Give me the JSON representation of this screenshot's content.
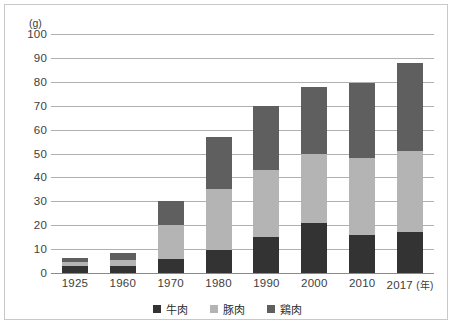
{
  "chart_data": {
    "type": "bar",
    "subtype": "stacked",
    "title": "",
    "xlabel": "",
    "ylabel": "",
    "unit_label": "(g)",
    "x_axis_unit": "(年)",
    "categories": [
      "1925",
      "1960",
      "1970",
      "1980",
      "1990",
      "2000",
      "2010",
      "2017"
    ],
    "ylim": [
      0,
      100
    ],
    "ytick_labels": [
      "0",
      "10",
      "20",
      "30",
      "40",
      "50",
      "60",
      "70",
      "80",
      "90",
      "100"
    ],
    "ytick_values": [
      0,
      10,
      20,
      30,
      40,
      50,
      60,
      70,
      80,
      90,
      100
    ],
    "grid": true,
    "legend_position": "bottom",
    "series": [
      {
        "name": "牛肉",
        "color": "#333333",
        "values": [
          3,
          3,
          6,
          9.5,
          15,
          21,
          16,
          17
        ]
      },
      {
        "name": "豚肉",
        "color": "#b4b4b4",
        "values": [
          1.5,
          2.5,
          14,
          25.5,
          28,
          29,
          32,
          34
        ]
      },
      {
        "name": "鶏肉",
        "color": "#5f5f5f",
        "values": [
          2,
          3,
          10,
          22,
          27,
          28,
          31.5,
          37
        ]
      }
    ],
    "totals": [
      6.5,
      8.5,
      30,
      57,
      70,
      78,
      79.5,
      88
    ]
  }
}
